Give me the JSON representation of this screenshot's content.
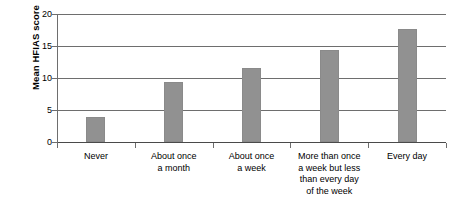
{
  "chart_data": {
    "type": "bar",
    "title": "",
    "xlabel": "",
    "ylabel": "Mean HFIAS score",
    "ylim": [
      0,
      20
    ],
    "yticks": [
      0,
      5,
      10,
      15,
      20
    ],
    "ytick_labels": [
      "0",
      "5",
      "10",
      "15",
      "20"
    ],
    "grid": true,
    "legend": "none",
    "bar_color": "#919191",
    "axis_color": "#6e6e6e",
    "categories": [
      "Never",
      "About once a month",
      "About once a week",
      "More than once a week but less than every day of the week",
      "Every day"
    ],
    "category_lines": [
      [
        "Never"
      ],
      [
        "About once",
        "a month"
      ],
      [
        "About once",
        "a week"
      ],
      [
        "More than once",
        "a week but less",
        "than every day",
        "of the week"
      ],
      [
        "Every day"
      ]
    ],
    "values": [
      3.9,
      9.4,
      11.5,
      14.4,
      17.6
    ]
  }
}
